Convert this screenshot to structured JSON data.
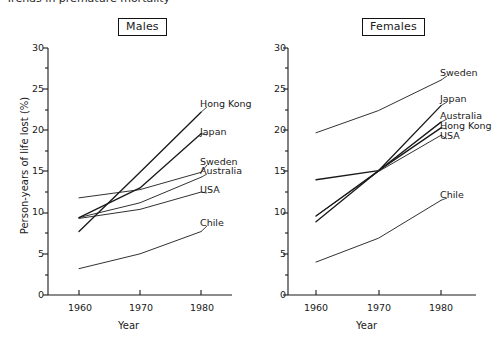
{
  "figure": {
    "cropped_header_text": "Trends in premature mortality",
    "y_axis_label": "Person-years of life lost (%)",
    "x_axis_label": "Year"
  },
  "panels": [
    {
      "key": "males",
      "title": "Males"
    },
    {
      "key": "females",
      "title": "Females"
    }
  ],
  "axes": {
    "y_ticks_major": [
      "0",
      "5",
      "10",
      "15",
      "20",
      "25",
      "30"
    ],
    "x_ticks": [
      "1960",
      "1970",
      "1980"
    ]
  },
  "chart_data": [
    {
      "type": "line",
      "title": "Males",
      "xlabel": "Year",
      "ylabel": "Person-years of life lost (%)",
      "x": [
        1960,
        1970,
        1980
      ],
      "xlim": [
        1955,
        1985
      ],
      "ylim": [
        0,
        30
      ],
      "ytick_step_major": 5,
      "ytick_step_minor": 2.5,
      "grid": false,
      "legend": "inline-end-labels",
      "series": [
        {
          "name": "Hong Kong",
          "values": [
            7.7,
            14.9,
            22.2
          ]
        },
        {
          "name": "Japan",
          "values": [
            9.4,
            13.0,
            19.6
          ]
        },
        {
          "name": "Sweden",
          "values": [
            11.8,
            12.8,
            14.9
          ]
        },
        {
          "name": "Australia",
          "values": [
            9.4,
            11.2,
            14.3
          ]
        },
        {
          "name": "USA",
          "values": [
            9.3,
            10.4,
            12.5
          ]
        },
        {
          "name": "Chile",
          "values": [
            3.2,
            5.0,
            7.7
          ]
        }
      ]
    },
    {
      "type": "line",
      "title": "Females",
      "xlabel": "Year",
      "ylabel": "Person-years of life lost (%)",
      "x": [
        1960,
        1970,
        1980
      ],
      "xlim": [
        1955,
        1985
      ],
      "ylim": [
        0,
        30
      ],
      "ytick_step_major": 5,
      "ytick_step_minor": 2.5,
      "grid": false,
      "legend": "inline-end-labels",
      "series": [
        {
          "name": "Sweden",
          "values": [
            19.7,
            22.4,
            26.1
          ]
        },
        {
          "name": "Japan",
          "values": [
            14.0,
            15.1,
            23.0
          ]
        },
        {
          "name": "Australia",
          "values": [
            9.6,
            15.1,
            21.0
          ]
        },
        {
          "name": "Hong Kong",
          "values": [
            8.9,
            15.1,
            20.3
          ]
        },
        {
          "name": "USA",
          "values": [
            9.6,
            15.0,
            19.4
          ]
        },
        {
          "name": "Chile",
          "values": [
            4.0,
            6.9,
            11.5
          ]
        }
      ]
    }
  ],
  "series_labels": {
    "males": [
      {
        "name": "Hong Kong",
        "text": "Hong Kong"
      },
      {
        "name": "Japan",
        "text": "Japan"
      },
      {
        "name": "Sweden",
        "text": "Sweden"
      },
      {
        "name": "Australia",
        "text": "Australia"
      },
      {
        "name": "USA",
        "text": "USA"
      },
      {
        "name": "Chile",
        "text": "Chile"
      }
    ],
    "females": [
      {
        "name": "Sweden",
        "text": "Sweden"
      },
      {
        "name": "Japan",
        "text": "Japan"
      },
      {
        "name": "Australia",
        "text": "Australia"
      },
      {
        "name": "Hong Kong",
        "text": "Hong Kong"
      },
      {
        "name": "USA",
        "text": "USA"
      },
      {
        "name": "Chile",
        "text": "Chile"
      }
    ]
  }
}
